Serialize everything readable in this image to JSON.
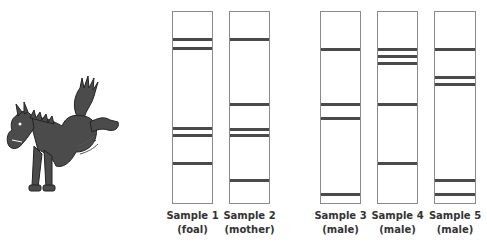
{
  "illustration": {
    "subject": "cartoon bucking horse (foal)",
    "icon": "horse-icon"
  },
  "gel": {
    "lane_top": 11,
    "lane_height": 193,
    "band_color": "#4a4a4a",
    "border_color": "#8a8a8a",
    "lanes": [
      {
        "name": "Sample 1",
        "sub": "(foal)",
        "left": 172,
        "width": 41,
        "bands_y": [
          38,
          47,
          127,
          134,
          162
        ]
      },
      {
        "name": "Sample 2",
        "sub": "(mother)",
        "left": 229,
        "width": 41,
        "bands_y": [
          38,
          103,
          128,
          134,
          179
        ]
      },
      {
        "name": "Sample 3",
        "sub": "(male)",
        "left": 320,
        "width": 41,
        "bands_y": [
          48,
          103,
          117,
          193
        ]
      },
      {
        "name": "Sample 4",
        "sub": "(male)",
        "left": 377,
        "width": 41,
        "bands_y": [
          48,
          55,
          62,
          103,
          162
        ]
      },
      {
        "name": "Sample 5",
        "sub": "(male)",
        "left": 434,
        "width": 42,
        "bands_y": [
          48,
          76,
          83,
          179,
          193
        ]
      }
    ]
  }
}
